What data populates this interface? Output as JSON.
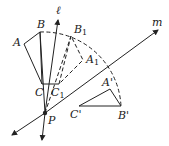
{
  "diagram": {
    "type": "geometry-rotation",
    "labels": {
      "A": "A",
      "B": "B",
      "C": "C",
      "A1": "A",
      "A1_sub": "1",
      "B1": "B",
      "B1_sub": "1",
      "C1": "C",
      "C1_sub": "1",
      "A_prime": "A'",
      "B_prime": "B'",
      "C_prime": "C'",
      "P": "P",
      "line_l": "ℓ",
      "line_m": "m"
    },
    "colors": {
      "stroke": "#222222",
      "background": "#ffffff"
    }
  }
}
